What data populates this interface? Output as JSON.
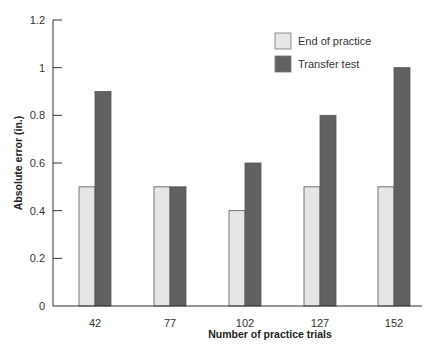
{
  "chart_data": {
    "type": "bar",
    "title": "",
    "xlabel": "Number of practice trials",
    "ylabel": "Absolute error (in.)",
    "categories": [
      "42",
      "77",
      "102",
      "127",
      "152"
    ],
    "series": [
      {
        "name": "End of practice",
        "values": [
          0.5,
          0.5,
          0.4,
          0.5,
          0.5
        ],
        "color": "#e6e6e6"
      },
      {
        "name": "Transfer test",
        "values": [
          0.9,
          0.5,
          0.6,
          0.8,
          1.0
        ],
        "color": "#616161"
      }
    ],
    "ylim": [
      0,
      1.2
    ],
    "yticks": [
      "0",
      "0.2",
      "0.4",
      "0.6",
      "0.8",
      "1",
      "1.2"
    ],
    "grid": false,
    "legend_position": "top-right"
  }
}
